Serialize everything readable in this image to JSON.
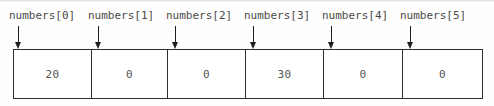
{
  "diagram": {
    "colors": {
      "background": "#ffffff",
      "border": "#2e2e2e",
      "label_text": "#4a4a4a",
      "value_text": "#555555",
      "arrow": "#1d1d1d"
    },
    "array_name": "numbers",
    "length": 6,
    "labels": [
      "numbers[0]",
      "numbers[1]",
      "numbers[2]",
      "numbers[3]",
      "numbers[4]",
      "numbers[5]"
    ],
    "cells": [
      {
        "index": "0",
        "value": "20"
      },
      {
        "index": "1",
        "value": "0"
      },
      {
        "index": "2",
        "value": "0"
      },
      {
        "index": "3",
        "value": "30"
      },
      {
        "index": "4",
        "value": "0"
      },
      {
        "index": "5",
        "value": "0"
      }
    ]
  }
}
